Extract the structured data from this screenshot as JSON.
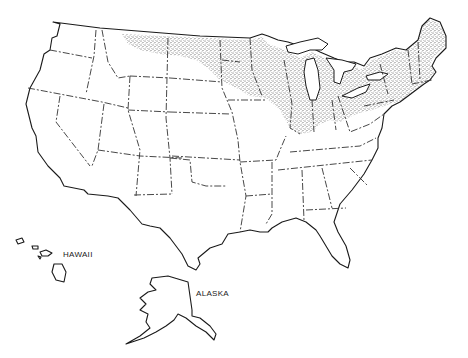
{
  "figure": {
    "type": "distribution-map",
    "region": "United States",
    "style": "black-and-white line map with stippled shading",
    "colors": {
      "background": "#ffffff",
      "outline": "#1a1a1a",
      "shading": "#555555"
    }
  },
  "labels": {
    "hawaii": "HAWAII",
    "alaska": "ALASKA"
  },
  "shaded_region": {
    "description": "Stippled area covering northern Great Plains, Upper Midwest, Great Lakes region and Northeast",
    "states_covered": [
      "Montana (northeast)",
      "North Dakota",
      "South Dakota (east)",
      "Nebraska (east)",
      "Minnesota",
      "Iowa",
      "Wisconsin",
      "Michigan",
      "Illinois",
      "Indiana",
      "Ohio",
      "Pennsylvania",
      "New York",
      "Vermont",
      "New Hampshire",
      "Maine",
      "Massachusetts",
      "Connecticut",
      "Rhode Island",
      "New Jersey"
    ]
  },
  "caption": ""
}
